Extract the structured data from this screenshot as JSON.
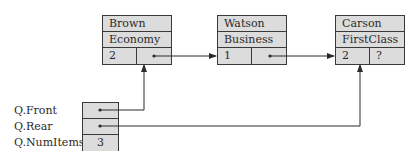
{
  "nodes": [
    {
      "name": "Brown",
      "class": "Economy",
      "num": "2",
      "next": "pointer"
    },
    {
      "name": "Watson",
      "class": "Business",
      "num": "1",
      "next": "pointer"
    },
    {
      "name": "Carson",
      "class": "FirstClass",
      "num": "2",
      "next": "?"
    }
  ],
  "queue": {
    "labels": [
      "Q.Front",
      "Q.Rear",
      "Q.NumItems"
    ],
    "front": "pointer",
    "rear": "pointer",
    "num_items": "3"
  },
  "colors": {
    "box_fill": "#dcdcdc",
    "line": "#2a2a2a"
  }
}
